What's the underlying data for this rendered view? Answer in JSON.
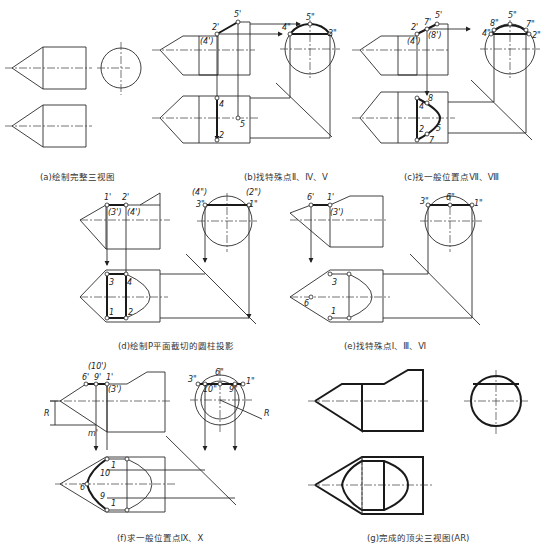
{
  "figure": {
    "panels": [
      {
        "id": "a",
        "caption": "(a)绘制完整三视图",
        "labels": []
      },
      {
        "id": "b",
        "caption": "(b)找特殊点Ⅱ、Ⅳ、Ⅴ",
        "labels": [
          "2'",
          "(4')",
          "5'",
          "4\"",
          "5\"",
          "2\"",
          "4",
          "2",
          "5"
        ]
      },
      {
        "id": "c",
        "caption": "(c)找一般位置点Ⅶ、Ⅷ",
        "labels": [
          "2'",
          "7'",
          "5'",
          "(4')",
          "(8')",
          "8\"",
          "5\"",
          "7\"",
          "4\"",
          "2\"",
          "8",
          "4",
          "2",
          "5",
          "7"
        ]
      },
      {
        "id": "d",
        "caption": "(d)绘制P平面截切的圆柱投影",
        "labels": [
          "1'",
          "2'",
          "(3')",
          "(4')",
          "(4\")",
          "(2\")",
          "3\"",
          "1\"",
          "3",
          "4",
          "1",
          "2"
        ]
      },
      {
        "id": "e",
        "caption": "(e)找特殊点Ⅰ、Ⅲ、Ⅵ",
        "labels": [
          "6'",
          "1'",
          "(3')",
          "3\"",
          "6\"",
          "1\"",
          "3",
          "6",
          "1"
        ]
      },
      {
        "id": "f",
        "caption": "(f)求一般位置点Ⅸ、Ⅹ",
        "labels": [
          "(10')",
          "6'",
          "9'",
          "1'",
          "(3')",
          "R",
          "m'",
          "3\"",
          "6\"",
          "10\"",
          "9\"",
          "1\"",
          "R",
          "1",
          "10",
          "6",
          "9",
          "1"
        ]
      },
      {
        "id": "g",
        "caption": "(g)完成的顶尖三视图(AR)",
        "labels": []
      }
    ]
  }
}
